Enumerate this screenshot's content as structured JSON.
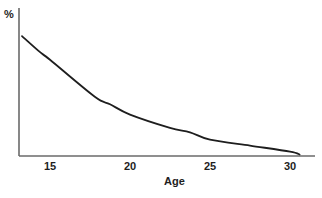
{
  "chart_data": {
    "type": "line",
    "title": "",
    "xlabel": "Age",
    "ylabel": "%",
    "xticks": [
      15,
      20,
      25,
      30
    ],
    "xlim": [
      13,
      31.5
    ],
    "ylim": [
      0,
      100
    ],
    "y_scale_note": "no numeric y ticks shown; y values are relative heights (0-100) of the axis span",
    "grid": false,
    "legend": null,
    "series": [
      {
        "name": "%",
        "color": "#1e1e1e",
        "x": [
          13.25,
          14.4,
          15,
          17.8,
          18.75,
          20,
          22.5,
          23.75,
          25,
          27.5,
          30,
          30.6
        ],
        "y": [
          81,
          70,
          65,
          40,
          35,
          28,
          19,
          16,
          11,
          7,
          3,
          1
        ]
      }
    ]
  },
  "labels": {
    "y_axis": "%",
    "x_axis": "Age",
    "x_ticks": [
      "15",
      "20",
      "25",
      "30"
    ]
  },
  "colors": {
    "axis": "#6a6a6a",
    "curve": "#1e1e1e",
    "background": "#ffffff"
  }
}
